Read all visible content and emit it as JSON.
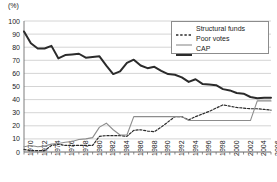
{
  "chart_data": {
    "type": "line",
    "title": "",
    "subtitle": "",
    "xlabel": "",
    "ylabel": "(%)",
    "yunit": "(%)",
    "xlim": [
      1970,
      2006
    ],
    "ylim": [
      0,
      100
    ],
    "grid": true,
    "grid_axis": "y",
    "legend_position": "top-right",
    "yticks": [
      0,
      10,
      20,
      30,
      40,
      50,
      60,
      70,
      80,
      90,
      100
    ],
    "ytick_labels": [
      "0",
      "10",
      "20",
      "30",
      "40",
      "50",
      "60",
      "70",
      "80",
      "90",
      "100"
    ],
    "xticks": [
      1970,
      1972,
      1974,
      1976,
      1978,
      1980,
      1982,
      1984,
      1986,
      1988,
      1990,
      1992,
      1994,
      1996,
      1998,
      2000,
      2002,
      2004,
      2006
    ],
    "xtick_labels": [
      "1970",
      "1972",
      "1974",
      "1976",
      "1978",
      "1980",
      "1982",
      "1984",
      "1986",
      "1988",
      "1990",
      "1992",
      "1994",
      "1996",
      "1998",
      "2000",
      "2002",
      "2004",
      "2006"
    ],
    "x": [
      1970,
      1971,
      1972,
      1973,
      1974,
      1975,
      1976,
      1977,
      1978,
      1979,
      1980,
      1981,
      1982,
      1983,
      1984,
      1985,
      1986,
      1987,
      1988,
      1989,
      1990,
      1991,
      1992,
      1993,
      1994,
      1995,
      1996,
      1997,
      1998,
      1999,
      2000,
      2001,
      2002,
      2003,
      2004,
      2005,
      2006
    ],
    "series": [
      {
        "name": "Structural funds",
        "style": "dashed",
        "color": "#2b2b2b",
        "width": 1.2,
        "values": [
          2,
          1,
          1,
          1,
          5,
          6,
          5,
          5,
          5,
          5,
          5,
          12,
          12.5,
          12.5,
          12.5,
          12,
          16.5,
          17,
          16,
          15.5,
          19,
          23,
          27,
          27,
          24.5,
          27,
          29,
          31,
          33.5,
          36,
          35,
          34,
          33.5,
          33,
          33,
          32.5,
          32
        ]
      },
      {
        "name": "Poor votes",
        "style": "solid",
        "color": "#8c8c8c",
        "width": 1.1,
        "values": [
          4,
          5,
          4,
          4.5,
          6,
          6.5,
          7.5,
          8,
          9.5,
          10,
          11,
          19,
          22,
          17,
          13,
          13,
          27,
          27,
          27,
          27,
          27,
          27,
          27,
          27,
          24,
          24,
          24,
          24,
          24,
          24,
          24,
          24,
          24,
          24,
          39,
          39,
          39
        ]
      },
      {
        "name": "CAP",
        "style": "solid",
        "color": "#2b2b2b",
        "width": 2,
        "values": [
          92,
          83,
          79,
          79,
          81,
          71.5,
          74,
          74.5,
          75,
          72,
          72.5,
          73,
          66,
          59.5,
          61.5,
          68,
          70.5,
          66,
          64,
          65,
          62,
          59.5,
          59,
          57,
          53.5,
          55.5,
          52,
          51.5,
          51,
          48,
          47,
          45,
          44.5,
          42,
          41,
          41.5,
          41.5
        ]
      }
    ]
  },
  "legend": {
    "items": [
      {
        "label": "Structural funds",
        "style": "dashed"
      },
      {
        "label": "Poor votes",
        "style": "thin-solid"
      },
      {
        "label": "CAP",
        "style": "thick-solid"
      }
    ]
  },
  "colors": {
    "axis": "#6e6e6e",
    "grid": "#c9c9c9",
    "cap": "#2b2b2b",
    "poor_votes": "#8c8c8c",
    "structural_funds": "#2b2b2b",
    "text": "#1a1a1a",
    "background": "#ffffff"
  }
}
